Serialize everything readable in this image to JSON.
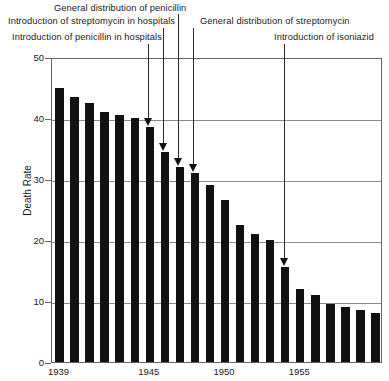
{
  "chart_data": {
    "type": "bar",
    "title": "",
    "xlabel": "",
    "ylabel": "Death Rate",
    "ylim": [
      0,
      50
    ],
    "yticks": [
      0,
      10,
      20,
      30,
      40,
      50
    ],
    "xticks": [
      1939,
      1945,
      1950,
      1955
    ],
    "grid": true,
    "legend": "none",
    "categories": [
      1939,
      1940,
      1941,
      1942,
      1943,
      1944,
      1945,
      1946,
      1947,
      1948,
      1949,
      1950,
      1951,
      1952,
      1953,
      1954,
      1955,
      1956,
      1957,
      1958,
      1959,
      1960
    ],
    "values": [
      45.0,
      43.5,
      42.5,
      41.0,
      40.5,
      40.0,
      38.5,
      34.5,
      32.0,
      31.0,
      29.0,
      26.5,
      22.5,
      21.0,
      20.0,
      15.5,
      12.0,
      11.0,
      9.5,
      9.0,
      8.5,
      8.0
    ],
    "annotations": [
      {
        "id": "ann-penicillin-hospitals",
        "label": "Introduction of penicillin in hospitals",
        "target_year": 1945,
        "target_value": 38.5
      },
      {
        "id": "ann-streptomycin-hospitals",
        "label": "Introduction of streptomycin in hospitals",
        "target_year": 1946,
        "target_value": 34.5
      },
      {
        "id": "ann-penicillin-general",
        "label": "General distribution of penicillin",
        "target_year": 1947,
        "target_value": 32.0
      },
      {
        "id": "ann-streptomycin-general",
        "label": "General distribution of streptomycin",
        "target_year": 1948,
        "target_value": 31.0
      },
      {
        "id": "ann-isoniazid",
        "label": "Introduction of isoniazid",
        "target_year": 1954,
        "target_value": 15.5
      }
    ]
  },
  "labels": {
    "line0": "General distribution of penicillin",
    "line1": "Introduction of streptomycin in hospitals",
    "line2": "General distribution of streptomycin",
    "line3": "Introduction of penicillin in hospitals",
    "line4": "Introduction of isoniazid"
  },
  "colors": {
    "bar": "#111111",
    "grid": "#8a8a8a",
    "axis": "#666666",
    "text": "#1a1a1a",
    "background": "#ffffff"
  }
}
